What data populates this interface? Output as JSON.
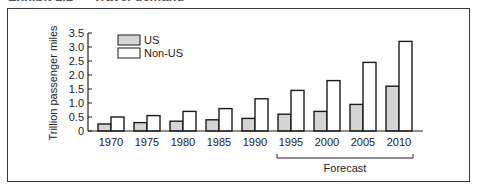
{
  "header": {
    "title": "Exhibit 1.1 — Travel demand"
  },
  "chart_data": {
    "type": "bar",
    "title": "",
    "xlabel": "",
    "ylabel": "Trillion passenger miles",
    "ylim": [
      0,
      3.5
    ],
    "yticks": [
      0,
      0.5,
      1.0,
      1.5,
      2.0,
      2.5,
      3.0,
      3.5
    ],
    "ytick_labels": [
      "0",
      "0.5",
      "1.0",
      "1.5",
      "2.0",
      "2.5",
      "3.0",
      "3.5"
    ],
    "categories": [
      "1970",
      "1975",
      "1980",
      "1985",
      "1990",
      "1995",
      "2000",
      "2005",
      "2010"
    ],
    "series": [
      {
        "name": "US",
        "fill": "#d4d4d4",
        "values": [
          0.25,
          0.3,
          0.35,
          0.4,
          0.45,
          0.6,
          0.7,
          0.95,
          1.6
        ]
      },
      {
        "name": "Non-US",
        "fill": "#ffffff",
        "values": [
          0.5,
          0.55,
          0.7,
          0.8,
          1.15,
          1.45,
          1.8,
          2.45,
          3.2
        ]
      }
    ],
    "legend": {
      "position": "top-left-inside",
      "entries": [
        "US",
        "Non-US"
      ]
    },
    "grid": false,
    "annotations": [
      {
        "text": "Forecast",
        "spans": [
          "1995",
          "2010"
        ],
        "type": "bracket-below-axis"
      }
    ]
  }
}
